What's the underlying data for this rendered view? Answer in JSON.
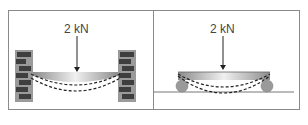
{
  "diagram": {
    "left_panel": {
      "description": "Fixed beam between brick walls",
      "load_label": "2 kN",
      "support_type": "fixed-brick-walls"
    },
    "right_panel": {
      "description": "Simply supported beam on rollers",
      "load_label": "2 kN",
      "support_type": "rollers"
    },
    "colors": {
      "border": "#8a8a8a",
      "brick_dark": "#3e3e3e",
      "brick_mortar": "#9a9a9a",
      "beam_light": "#e6e6e6",
      "beam_dark": "#8c8c8c",
      "roller": "#9a9a9a",
      "dash": "#222222"
    }
  }
}
